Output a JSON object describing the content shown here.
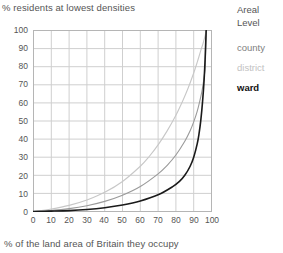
{
  "chart_data": {
    "type": "line",
    "title": "",
    "ylabel": "% residents at lowest densities",
    "xlabel": "% of the land area of Britain they occupy",
    "xlim": [
      0,
      100
    ],
    "ylim": [
      0,
      100
    ],
    "xticks": [
      0,
      10,
      20,
      30,
      40,
      50,
      60,
      70,
      80,
      90,
      100
    ],
    "yticks": [
      0,
      10,
      20,
      30,
      40,
      50,
      60,
      70,
      80,
      90,
      100
    ],
    "grid": true,
    "legend_position": "right",
    "legend_title": "Areal Level",
    "series": [
      {
        "name": "county",
        "color": "#9a9a9a",
        "x": [
          0,
          10,
          20,
          30,
          40,
          50,
          60,
          70,
          75,
          80,
          85,
          88,
          90,
          92,
          94,
          95,
          96,
          96.5,
          97
        ],
        "y": [
          0,
          0.6,
          1.6,
          3.2,
          5.6,
          9.0,
          13.8,
          20.8,
          25.4,
          31.2,
          38.8,
          44.6,
          49.5,
          55.5,
          63.5,
          68.5,
          75.5,
          80.5,
          100
        ]
      },
      {
        "name": "district",
        "color": "#c7c7c7",
        "x": [
          0,
          10,
          20,
          30,
          40,
          50,
          60,
          65,
          70,
          75,
          80,
          84,
          87,
          90,
          92,
          94,
          95,
          96,
          96.5,
          97
        ],
        "y": [
          0,
          1.4,
          3.4,
          6.4,
          10.6,
          16.6,
          25.0,
          30.4,
          36.8,
          44.4,
          53.2,
          61.5,
          68.5,
          76.5,
          82.5,
          89.0,
          92.0,
          95.5,
          97.5,
          100
        ]
      },
      {
        "name": "ward",
        "color": "#1a1a1a",
        "x": [
          0,
          10,
          20,
          30,
          40,
          50,
          60,
          70,
          78,
          82,
          85,
          88,
          90,
          92,
          93,
          94,
          95,
          95.8,
          96.4,
          97
        ],
        "y": [
          0,
          0.2,
          0.5,
          1.1,
          2.1,
          3.6,
          5.8,
          9.2,
          13.6,
          16.6,
          20.0,
          25.0,
          30.0,
          37.5,
          43.0,
          50.5,
          61.0,
          72.0,
          84.0,
          100
        ]
      }
    ]
  },
  "legend": {
    "title_line1": "Areal",
    "title_line2": "Level",
    "entries": [
      {
        "label": "county"
      },
      {
        "label": "district"
      },
      {
        "label": "ward"
      }
    ]
  },
  "axes": {
    "y_title": "% residents at lowest densities",
    "x_title": "% of the land area of Britain they occupy",
    "y_ticks": [
      "100",
      "90",
      "80",
      "70",
      "60",
      "50",
      "40",
      "30",
      "20",
      "10",
      "0"
    ],
    "x_ticks": [
      "0",
      "10",
      "20",
      "30",
      "40",
      "50",
      "60",
      "70",
      "80",
      "90",
      "100"
    ]
  }
}
